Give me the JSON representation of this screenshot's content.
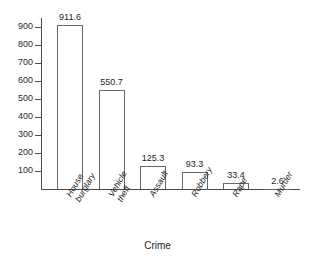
{
  "chart_data": {
    "type": "bar",
    "title": "",
    "xlabel": "Crime",
    "ylabel": "",
    "categories": [
      "House burglary",
      "Vehicle theft",
      "Assault",
      "Robbery",
      "Rape",
      "Murder"
    ],
    "category_lines": [
      [
        "House",
        "burglary"
      ],
      [
        "Vehicle",
        "theft"
      ],
      [
        "Assault"
      ],
      [
        "Robbery"
      ],
      [
        "Rape"
      ],
      [
        "Murder"
      ]
    ],
    "values": [
      911.6,
      550.7,
      125.3,
      93.3,
      33.4,
      2.6
    ],
    "value_labels": [
      "911.6",
      "550.7",
      "125.3",
      "93.3",
      "33.4",
      "2.6"
    ],
    "ylim": [
      0,
      950
    ],
    "yticks": [
      100,
      200,
      300,
      400,
      500,
      600,
      700,
      800,
      900
    ],
    "ytick_labels": [
      "100",
      "200",
      "300",
      "400",
      "500",
      "600",
      "700",
      "800",
      "900"
    ],
    "grid": false,
    "legend": false,
    "bar_fill_color": "#ffffff",
    "bar_edge_color": "#666666",
    "axis_color": "#4a4a4a",
    "text_color": "#1c1c1c",
    "background_color": "#ffffff"
  }
}
